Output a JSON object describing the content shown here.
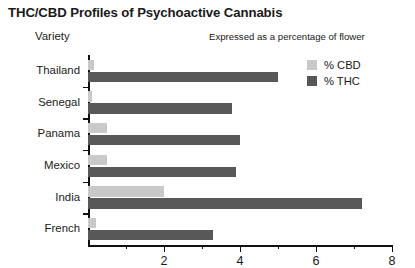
{
  "chart_data": {
    "type": "bar",
    "orientation": "horizontal",
    "title": "THC/CBD Profiles of Psychoactive Cannabis",
    "subtitle": "Expressed as a percentage of flower",
    "ylabel": "Variety",
    "xlabel": "",
    "xlim": [
      0,
      8
    ],
    "grid": false,
    "legend_position": "top-right",
    "categories": [
      "Thailand",
      "Senegal",
      "Panama",
      "Mexico",
      "India",
      "French"
    ],
    "series": [
      {
        "name": "% CBD",
        "color": "#c9c9c9",
        "values": [
          0.15,
          0.1,
          0.5,
          0.5,
          2.0,
          0.2
        ]
      },
      {
        "name": "% THC",
        "color": "#585858",
        "values": [
          5.0,
          3.8,
          4.0,
          3.9,
          7.2,
          3.3
        ]
      }
    ],
    "x_ticks_major": [
      0,
      2,
      4,
      6,
      8
    ],
    "x_ticks_minor": [
      1,
      3,
      5,
      7
    ],
    "x_tick_labels": [
      "2",
      "4",
      "6",
      "8"
    ],
    "x_tick_label_values": [
      2,
      4,
      6,
      8
    ]
  },
  "legend": {
    "items": [
      {
        "label": "% CBD",
        "color": "#c9c9c9"
      },
      {
        "label": "% THC",
        "color": "#585858"
      }
    ]
  }
}
